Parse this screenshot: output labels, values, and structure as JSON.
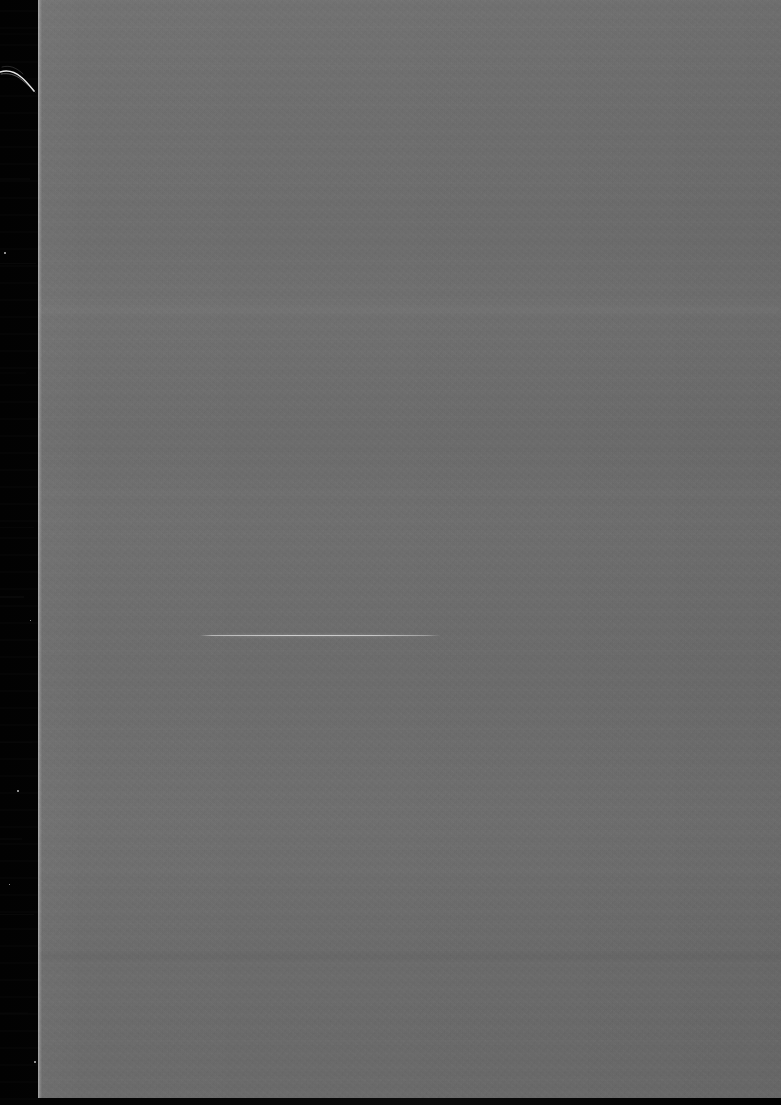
{
  "document": {
    "type": "scanned-page",
    "description": "Blank verso page of a scanned printed document",
    "page_label": "",
    "visible_text": "",
    "body_text": "",
    "has_text": false
  },
  "canvas": {
    "width": 781,
    "height": 1105,
    "background_color": "#000000"
  },
  "scanner_bed": {
    "name": "scanner-bed-margin",
    "color": "#050505",
    "side": "left",
    "x": 0,
    "y": 0,
    "width": 40,
    "height": 1105,
    "streak_bands": [
      {
        "x": 0,
        "y": 33,
        "width": 40,
        "height": 2
      },
      {
        "x": 0,
        "y": 178,
        "width": 30,
        "height": 2
      },
      {
        "x": 0,
        "y": 263,
        "width": 36,
        "height": 1
      },
      {
        "x": 0,
        "y": 372,
        "width": 26,
        "height": 2
      },
      {
        "x": 0,
        "y": 527,
        "width": 34,
        "height": 1
      },
      {
        "x": 0,
        "y": 596,
        "width": 24,
        "height": 2
      },
      {
        "x": 0,
        "y": 742,
        "width": 32,
        "height": 1
      },
      {
        "x": 0,
        "y": 838,
        "width": 22,
        "height": 2
      },
      {
        "x": 0,
        "y": 914,
        "width": 34,
        "height": 1
      },
      {
        "x": 0,
        "y": 1012,
        "width": 28,
        "height": 2
      }
    ]
  },
  "page_sheet": {
    "name": "scanned-paper-sheet",
    "paper_color": "#6e6e6e",
    "x": 38,
    "y": 0,
    "width": 743,
    "height": 1098,
    "edge_highlight_color": "#d8d8d8",
    "edge_x": 38
  },
  "tonal_bands": [
    {
      "label": "band-upper",
      "x": 38,
      "y": 306,
      "width": 743,
      "height": 6,
      "tint": "rgba(255,255,255,0.035)"
    },
    {
      "label": "band-mid",
      "x": 38,
      "y": 489,
      "width": 743,
      "height": 5,
      "tint": "rgba(255,255,255,0.024)"
    },
    {
      "label": "band-lower",
      "x": 38,
      "y": 866,
      "width": 743,
      "height": 5,
      "tint": "rgba(255,255,255,0.020)"
    },
    {
      "label": "band-shadow",
      "x": 38,
      "y": 952,
      "width": 743,
      "height": 8,
      "tint": "rgba(0,0,0,0.028)"
    }
  ],
  "marks": {
    "rule_line": {
      "name": "horizontal-rule-mark",
      "x_start": 200,
      "x_end": 440,
      "y": 635,
      "length": 240,
      "thickness": 1,
      "color": "#d2d2d2",
      "note": "faint light pen / bleed-through underline"
    },
    "hair_artifact": {
      "name": "hair-debris-artifact",
      "x": 0,
      "y": 58,
      "width": 40,
      "height": 44,
      "color": "#f2f2f2",
      "note": "curved white filament on scanner bed at left margin"
    },
    "specks": [
      {
        "x": 4,
        "y": 252,
        "size": 2
      },
      {
        "x": 30,
        "y": 620,
        "size": 1
      },
      {
        "x": 17,
        "y": 790,
        "size": 2
      },
      {
        "x": 9,
        "y": 884,
        "size": 1
      },
      {
        "x": 34,
        "y": 1061,
        "size": 2
      }
    ]
  }
}
